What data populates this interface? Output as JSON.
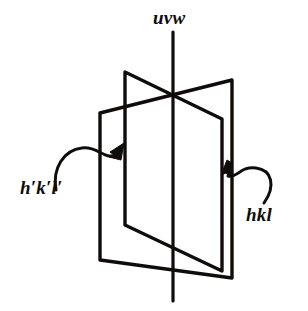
{
  "figure": {
    "background_color": "#ffffff",
    "ink_color": "#100c0a",
    "labels": {
      "zone_axis": "uvw",
      "plane_front": "h′k′l′",
      "plane_back": "hkl"
    },
    "icons": {
      "arrow_left": "curved-arrow-icon",
      "arrow_right": "curved-arrow-icon"
    },
    "geometry": {
      "zone_axis_line": {
        "x1": 173,
        "y1": 32,
        "x2": 173,
        "y2": 301
      },
      "intersection_top": {
        "x": 173,
        "y": 95
      },
      "intersection_bottom": {
        "x": 173,
        "y": 243
      },
      "plane_front": {
        "name": "h′k′l′",
        "corners": [
          {
            "x": 125,
            "y": 72
          },
          {
            "x": 222,
            "y": 119
          },
          {
            "x": 222,
            "y": 271
          },
          {
            "x": 125,
            "y": 225
          }
        ]
      },
      "plane_back": {
        "name": "hkl",
        "corners": [
          {
            "x": 232,
            "y": 80
          },
          {
            "x": 100,
            "y": 113
          },
          {
            "x": 100,
            "y": 260
          },
          {
            "x": 232,
            "y": 278
          }
        ]
      },
      "pointer_left": {
        "label": "h′k′l′",
        "path": "M 56 190 C 52 168 64 150 82 148 C 98 146 104 160 116 155",
        "tip": {
          "x": 122,
          "y": 146
        }
      },
      "pointer_right": {
        "label": "hkl",
        "path": "M 264 203 C 276 186 272 170 256 168 C 240 166 238 178 228 176",
        "tip": {
          "x": 226,
          "y": 163
        }
      }
    }
  }
}
